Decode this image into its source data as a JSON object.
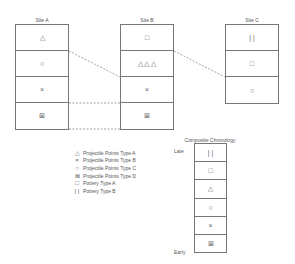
{
  "sites": [
    {
      "name": "Site A",
      "rows": [
        "△",
        "○",
        "×",
        "⊠"
      ]
    },
    {
      "name": "Site B",
      "rows": [
        "□",
        "△ △ △",
        "×",
        "⊠"
      ]
    },
    {
      "name": "Site C",
      "rows": [
        "| |",
        "□",
        "○"
      ]
    }
  ],
  "legend": [
    {
      "symbol": "△",
      "label": "Projectile Points Type A"
    },
    {
      "symbol": "×",
      "label": "Projectile Points Type B"
    },
    {
      "symbol": "○",
      "label": "Projectile Points Type C"
    },
    {
      "symbol": "⊠",
      "label": "Projectile Points Type D"
    },
    {
      "symbol": "□",
      "label": "Pottery Type A"
    },
    {
      "symbol": "| |",
      "label": "Pottery Type B"
    }
  ],
  "composite": {
    "title": "Composite Chronology",
    "late": "Late",
    "early": "Early",
    "rows": [
      "| |",
      "□",
      "△",
      "○",
      "×",
      "⊠"
    ]
  }
}
